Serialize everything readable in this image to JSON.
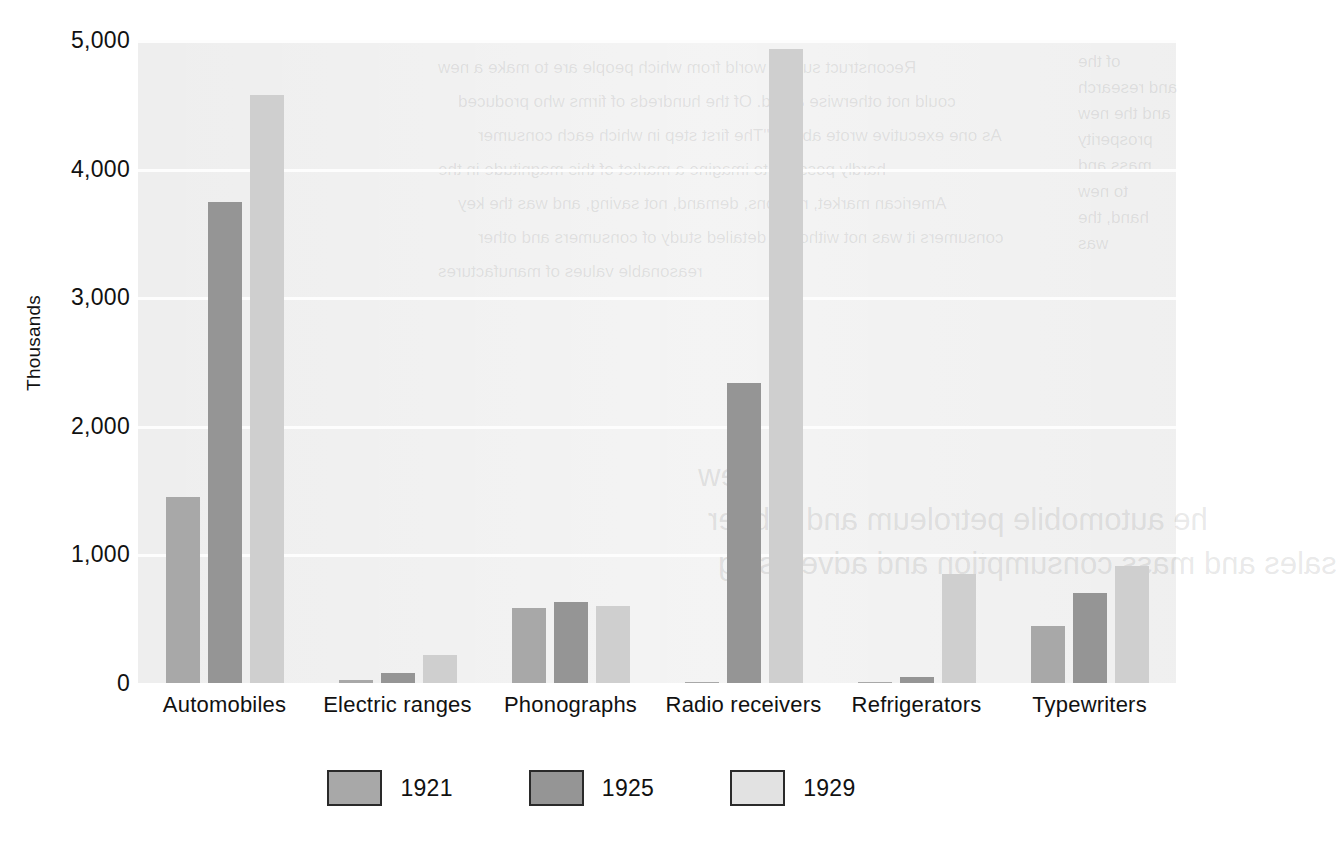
{
  "chart_data": {
    "type": "bar",
    "title": "",
    "xlabel": "",
    "ylabel": "Thousands",
    "ylim": [
      0,
      5000
    ],
    "yticks": [
      0,
      1000,
      2000,
      3000,
      4000,
      5000
    ],
    "ytick_labels": [
      "0",
      "1,000",
      "2,000",
      "3,000",
      "4,000",
      "5,000"
    ],
    "grid": true,
    "legend_position": "bottom",
    "categories": [
      "Automobiles",
      "Electric ranges",
      "Phonographs",
      "Radio receivers",
      "Refrigerators",
      "Typewriters"
    ],
    "series": [
      {
        "name": "1921",
        "color": "#a8a8a8",
        "values": [
          1450,
          20,
          580,
          10,
          5,
          440
        ]
      },
      {
        "name": "1925",
        "color": "#959595",
        "values": [
          3740,
          80,
          630,
          2330,
          45,
          700
        ]
      },
      {
        "name": "1929",
        "color": "#cfcfcf",
        "values": [
          4570,
          215,
          595,
          4930,
          850,
          910
        ]
      }
    ]
  },
  "legend": {
    "entries": [
      {
        "label": "1921",
        "swatch": "series-0-swatch"
      },
      {
        "label": "1925",
        "swatch": "series-1-swatch"
      },
      {
        "label": "1929",
        "swatch": "series-2-swatch"
      }
    ]
  },
  "colors": {
    "plot_background": "#eeeeee",
    "gridline": "#fdfdfd",
    "page_background": "#ffffff",
    "text": "#111111",
    "series_1921": "#a8a8a8",
    "series_1925": "#959595",
    "series_1929": "#cfcfcf"
  },
  "ghost_text": {
    "lines": [
      "Reconstruct such a world from which people are to make a new",
      "could not otherwise afford. Of the hundreds of firms who produced",
      "As one executive wrote about: \"The first step in which each consumer",
      "hardly possible to imagine a market of this magnitude in the",
      "American market, reasons, demand, not saving, and was the key",
      "consumers it was not without a detailed study of consumers and other",
      "reasonable values of manufactures"
    ],
    "watermark_lines": [
      "view",
      "he automobile petroleum and rubber",
      "sales and mass consumption and advertising"
    ],
    "margin_notes": [
      "of the",
      "and research",
      "and the new",
      "prosperity",
      "mass and",
      "to new",
      "hand, the",
      "was"
    ]
  }
}
